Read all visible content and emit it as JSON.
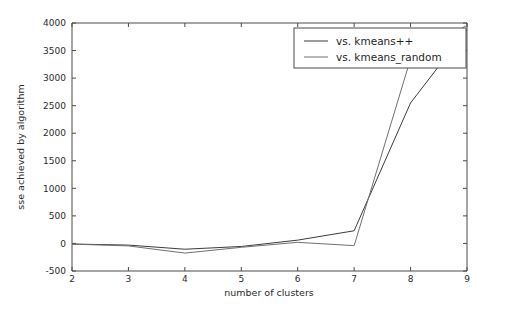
{
  "chart_data": {
    "type": "line",
    "title": "",
    "xlabel": "number of clusters",
    "ylabel": "sse achieved by algorithm",
    "x": [
      2,
      3,
      4,
      5,
      6,
      7,
      8,
      9
    ],
    "xlim": [
      2,
      9
    ],
    "ylim": [
      -500,
      4000
    ],
    "xticks": [
      2,
      3,
      4,
      5,
      6,
      7,
      8,
      9
    ],
    "yticks": [
      -500,
      0,
      500,
      1000,
      1500,
      2000,
      2500,
      3000,
      3500,
      4000
    ],
    "xtick_labels": [
      "2",
      "3",
      "4",
      "5",
      "6",
      "7",
      "8",
      "9"
    ],
    "ytick_labels": [
      "-500",
      "0",
      "500",
      "1000",
      "1500",
      "2000",
      "2500",
      "3000",
      "3500",
      "4000"
    ],
    "grid": false,
    "legend_position": "upper right",
    "series": [
      {
        "name": "vs. kmeans++",
        "color": "#3c3c3c",
        "values": [
          -10,
          -30,
          -105,
          -55,
          60,
          230,
          2550,
          3880
        ]
      },
      {
        "name": "vs. kmeans_random",
        "color": "#707070",
        "values": [
          -12,
          -45,
          -175,
          -70,
          20,
          -40,
          3350,
          3960
        ]
      }
    ]
  },
  "legend": {
    "entries": [
      {
        "label": "vs. kmeans++"
      },
      {
        "label": "vs. kmeans_random"
      }
    ]
  },
  "axes": {
    "x_title": "number of clusters",
    "y_title": "sse achieved by algorithm"
  }
}
